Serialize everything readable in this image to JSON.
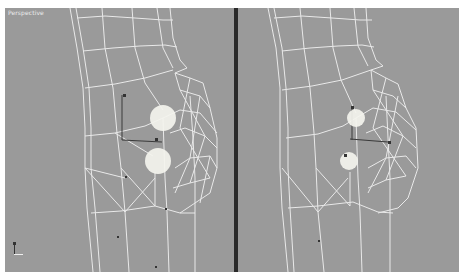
{
  "viewports": [
    {
      "label": "Perspective",
      "view": "left",
      "gizmos": [
        {
          "name": "upper-sphere",
          "cx": 158,
          "cy": 110,
          "r": 13
        },
        {
          "name": "lower-sphere",
          "cx": 153,
          "cy": 153,
          "r": 13
        }
      ]
    },
    {
      "label": "",
      "view": "right",
      "gizmos": [
        {
          "name": "upper-sphere",
          "cx": 118,
          "cy": 110,
          "r": 9
        },
        {
          "name": "lower-sphere",
          "cx": 111,
          "cy": 153,
          "r": 9
        }
      ]
    }
  ],
  "colors": {
    "viewport_bg": "#9a9a9a",
    "wire": "#f2f2f2",
    "divider": "#2a2a2a",
    "gizmo": "#f4f4ee",
    "link": "#3a3a3a"
  },
  "axis_tripod": {
    "x_label": "",
    "y_label": "",
    "z_label": ""
  }
}
